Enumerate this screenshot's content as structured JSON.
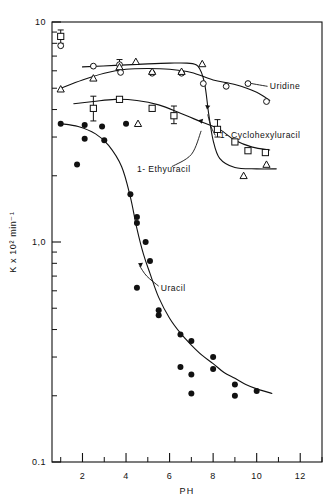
{
  "chart_data": {
    "type": "scatter",
    "title": "",
    "xlabel": "PH",
    "ylabel": "K x 10² min⁻¹",
    "xscale": "linear",
    "yscale": "log",
    "xlim": [
      0.6,
      13.0
    ],
    "ylim": [
      0.1,
      10
    ],
    "grid": false,
    "legend_position": "inline-annotations",
    "xticks": [
      2,
      4,
      6,
      8,
      10,
      12
    ],
    "xtick_labels": [
      "2",
      "4",
      "6",
      "8",
      "10",
      "12"
    ],
    "xminorticks": [
      1,
      3,
      5,
      7,
      9,
      11,
      13
    ],
    "yticks": [
      0.1,
      1.0,
      10
    ],
    "ytick_labels": [
      "0.1",
      "1,0",
      "10"
    ],
    "yminorticks": [
      0.2,
      0.3,
      0.4,
      0.5,
      0.6,
      0.7,
      0.8,
      0.9,
      2,
      3,
      4,
      5,
      6,
      7,
      8,
      9
    ],
    "annotations": [
      {
        "text": "Uridine",
        "x": 10.6,
        "y": 5.1
      },
      {
        "text": "1- Cyclohexyluracil",
        "x": 8.3,
        "y": 3.05
      },
      {
        "text": "1- Ethyuracil",
        "x": 4.5,
        "y": 2.15
      },
      {
        "text": "Uracil",
        "x": 5.6,
        "y": 0.62
      }
    ],
    "series": [
      {
        "name": "Uridine",
        "marker": "open-circle",
        "color": "#000000",
        "points": [
          {
            "x": 1.0,
            "y": 7.8
          },
          {
            "x": 2.5,
            "y": 6.3
          },
          {
            "x": 3.7,
            "y": 6.4
          },
          {
            "x": 3.75,
            "y": 5.9
          },
          {
            "x": 5.2,
            "y": 5.85
          },
          {
            "x": 6.55,
            "y": 5.85
          },
          {
            "x": 7.55,
            "y": 5.25
          },
          {
            "x": 8.6,
            "y": 5.1
          },
          {
            "x": 9.6,
            "y": 5.25
          },
          {
            "x": 10.45,
            "y": 4.35
          }
        ]
      },
      {
        "name": "1- Cyclohexyluracil",
        "marker": "open-triangle",
        "color": "#000000",
        "points": [
          {
            "x": 1.0,
            "y": 4.95
          },
          {
            "x": 2.5,
            "y": 5.55
          },
          {
            "x": 3.7,
            "y": 6.25
          },
          {
            "x": 4.45,
            "y": 6.6
          },
          {
            "x": 5.2,
            "y": 5.95
          },
          {
            "x": 6.55,
            "y": 5.95
          },
          {
            "x": 7.5,
            "y": 6.45
          },
          {
            "x": 10.45,
            "y": 2.25
          },
          {
            "x": 9.4,
            "y": 2.0
          },
          {
            "x": 4.55,
            "y": 3.45
          }
        ]
      },
      {
        "name": "1- Ethyuracil",
        "marker": "open-square",
        "color": "#000000",
        "points": [
          {
            "x": 1.0,
            "y": 8.6
          },
          {
            "x": 2.5,
            "y": 4.05
          },
          {
            "x": 3.7,
            "y": 4.45
          },
          {
            "x": 5.2,
            "y": 4.05
          },
          {
            "x": 6.2,
            "y": 3.75
          },
          {
            "x": 8.2,
            "y": 3.25
          },
          {
            "x": 9.0,
            "y": 2.85
          },
          {
            "x": 9.6,
            "y": 2.6
          },
          {
            "x": 10.4,
            "y": 2.55
          }
        ]
      },
      {
        "name": "Uracil",
        "marker": "filled-circle",
        "color": "#000000",
        "points": [
          {
            "x": 1.0,
            "y": 3.45
          },
          {
            "x": 2.1,
            "y": 3.4
          },
          {
            "x": 2.1,
            "y": 2.95
          },
          {
            "x": 2.9,
            "y": 3.35
          },
          {
            "x": 3.0,
            "y": 2.9
          },
          {
            "x": 1.75,
            "y": 2.25
          },
          {
            "x": 4.0,
            "y": 3.45
          },
          {
            "x": 4.2,
            "y": 1.65
          },
          {
            "x": 4.5,
            "y": 1.22
          },
          {
            "x": 4.5,
            "y": 1.3
          },
          {
            "x": 4.9,
            "y": 1.0
          },
          {
            "x": 5.1,
            "y": 0.82
          },
          {
            "x": 4.5,
            "y": 0.62
          },
          {
            "x": 5.5,
            "y": 0.49
          },
          {
            "x": 5.5,
            "y": 0.465
          },
          {
            "x": 6.5,
            "y": 0.38
          },
          {
            "x": 7.0,
            "y": 0.355
          },
          {
            "x": 6.5,
            "y": 0.27
          },
          {
            "x": 7.0,
            "y": 0.25
          },
          {
            "x": 8.0,
            "y": 0.3
          },
          {
            "x": 8.0,
            "y": 0.265
          },
          {
            "x": 7.0,
            "y": 0.205
          },
          {
            "x": 9.0,
            "y": 0.225
          },
          {
            "x": 9.0,
            "y": 0.2
          },
          {
            "x": 10.0,
            "y": 0.21
          }
        ]
      }
    ],
    "errorbars": [
      {
        "x": 2.5,
        "y": 4.05,
        "low": 3.55,
        "high": 4.6
      },
      {
        "x": 3.7,
        "y": 6.25,
        "low": 6.0,
        "high": 6.75
      },
      {
        "x": 6.2,
        "y": 3.75,
        "low": 3.45,
        "high": 4.15
      },
      {
        "x": 8.2,
        "y": 3.25,
        "low": 3.0,
        "high": 3.6
      },
      {
        "x": 1.0,
        "y": 8.6,
        "low": 8.0,
        "high": 9.2
      }
    ],
    "curves": [
      {
        "name": "uridine-curve",
        "points": [
          [
            1.0,
            5.0
          ],
          [
            2.0,
            5.45
          ],
          [
            3.0,
            5.85
          ],
          [
            4.0,
            6.1
          ],
          [
            5.0,
            6.15
          ],
          [
            6.0,
            6.1
          ],
          [
            7.0,
            5.9
          ],
          [
            8.0,
            5.45
          ],
          [
            9.0,
            5.2
          ],
          [
            10.0,
            4.8
          ],
          [
            10.6,
            4.4
          ]
        ]
      },
      {
        "name": "cyclohexyluracil-curve",
        "points": [
          [
            2.0,
            6.25
          ],
          [
            3.5,
            6.35
          ],
          [
            5.0,
            6.45
          ],
          [
            6.0,
            6.5
          ],
          [
            6.8,
            6.5
          ],
          [
            7.3,
            6.3
          ],
          [
            7.6,
            5.3
          ],
          [
            7.8,
            3.8
          ],
          [
            8.0,
            2.9
          ],
          [
            8.3,
            2.4
          ],
          [
            9.0,
            2.18
          ],
          [
            10.0,
            2.15
          ],
          [
            10.9,
            2.15
          ]
        ]
      },
      {
        "name": "ethyuracil-curve",
        "points": [
          [
            1.6,
            4.25
          ],
          [
            2.5,
            4.35
          ],
          [
            3.5,
            4.45
          ],
          [
            4.5,
            4.4
          ],
          [
            5.5,
            4.2
          ],
          [
            6.5,
            3.85
          ],
          [
            7.5,
            3.5
          ],
          [
            8.3,
            3.25
          ],
          [
            9.0,
            2.9
          ],
          [
            9.8,
            2.7
          ],
          [
            10.6,
            2.62
          ]
        ]
      },
      {
        "name": "uracil-curve",
        "points": [
          [
            1.0,
            3.45
          ],
          [
            1.8,
            3.35
          ],
          [
            2.6,
            3.1
          ],
          [
            3.2,
            2.75
          ],
          [
            3.8,
            2.2
          ],
          [
            4.2,
            1.6
          ],
          [
            4.5,
            1.15
          ],
          [
            4.8,
            0.88
          ],
          [
            5.1,
            0.72
          ],
          [
            5.5,
            0.56
          ],
          [
            6.0,
            0.45
          ],
          [
            6.5,
            0.385
          ],
          [
            7.0,
            0.34
          ],
          [
            7.5,
            0.305
          ],
          [
            8.0,
            0.28
          ],
          [
            8.5,
            0.255
          ],
          [
            9.0,
            0.24
          ],
          [
            9.5,
            0.225
          ],
          [
            10.0,
            0.215
          ],
          [
            10.7,
            0.205
          ]
        ]
      }
    ],
    "leaders": [
      {
        "name": "uridine-leader",
        "points": [
          [
            9.55,
            5.3
          ],
          [
            10.0,
            5.2
          ],
          [
            10.5,
            5.1
          ]
        ]
      },
      {
        "name": "cyclohexyluracil-leader",
        "points": [
          [
            8.1,
            3.05
          ],
          [
            7.9,
            3.35
          ],
          [
            7.75,
            3.8
          ]
        ]
      },
      {
        "name": "ethyuracil-leader",
        "points": [
          [
            6.1,
            2.2
          ],
          [
            7.0,
            2.5
          ],
          [
            7.45,
            3.2
          ]
        ]
      },
      {
        "name": "uracil-leader",
        "points": [
          [
            5.5,
            0.63
          ],
          [
            4.95,
            0.7
          ],
          [
            4.62,
            0.78
          ]
        ]
      }
    ]
  },
  "figure": {
    "yaxis_top_label": "10",
    "yaxis_mid_label": "1,0",
    "yaxis_bottom_label": "0,1",
    "xaxis_title": "PH",
    "yaxis_title": "K x 10² min⁻¹"
  }
}
